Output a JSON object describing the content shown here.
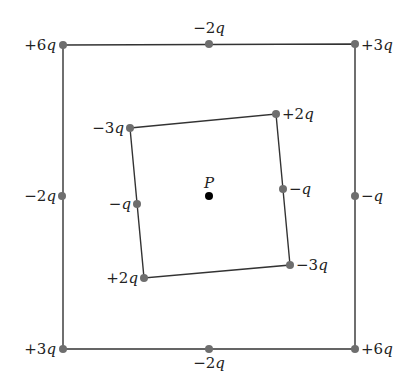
{
  "figure": {
    "point_label": "P",
    "outer_square": {
      "charges": [
        {
          "id": "outer-top-left",
          "label": "+6q",
          "sign": "+",
          "value": "6",
          "x": 63,
          "y": 45,
          "lx": 56,
          "ly": 50,
          "anchor": "end"
        },
        {
          "id": "outer-top-mid",
          "label": "−2q",
          "sign": "−",
          "value": "2",
          "x": 209,
          "y": 44,
          "lx": 209,
          "ly": 33,
          "anchor": "middle"
        },
        {
          "id": "outer-top-right",
          "label": "+3q",
          "sign": "+",
          "value": "3",
          "x": 355,
          "y": 44,
          "lx": 361,
          "ly": 50,
          "anchor": "start"
        },
        {
          "id": "outer-mid-left",
          "label": "−2q",
          "sign": "−",
          "value": "2",
          "x": 62,
          "y": 196,
          "lx": 56,
          "ly": 201,
          "anchor": "end"
        },
        {
          "id": "outer-mid-right",
          "label": "−q",
          "sign": "−",
          "value": "",
          "x": 355,
          "y": 196,
          "lx": 361,
          "ly": 201,
          "anchor": "start"
        },
        {
          "id": "outer-bottom-left",
          "label": "+3q",
          "sign": "+",
          "value": "3",
          "x": 63,
          "y": 349,
          "lx": 56,
          "ly": 354,
          "anchor": "end"
        },
        {
          "id": "outer-bottom-mid",
          "label": "−2q",
          "sign": "−",
          "value": "2",
          "x": 209,
          "y": 349,
          "lx": 209,
          "ly": 368,
          "anchor": "middle"
        },
        {
          "id": "outer-bottom-right",
          "label": "+6q",
          "sign": "+",
          "value": "6",
          "x": 355,
          "y": 349,
          "lx": 361,
          "ly": 354,
          "anchor": "start"
        }
      ]
    },
    "inner_square": {
      "charges": [
        {
          "id": "inner-top-left",
          "label": "−3q",
          "sign": "−",
          "value": "3",
          "x": 130,
          "y": 128,
          "lx": 124,
          "ly": 133,
          "anchor": "end"
        },
        {
          "id": "inner-top-right",
          "label": "+2q",
          "sign": "+",
          "value": "2",
          "x": 276,
          "y": 114,
          "lx": 282,
          "ly": 119,
          "anchor": "start"
        },
        {
          "id": "inner-mid-left",
          "label": "−q",
          "sign": "−",
          "value": "",
          "x": 137,
          "y": 204,
          "lx": 131,
          "ly": 209,
          "anchor": "end"
        },
        {
          "id": "inner-mid-right",
          "label": "−q",
          "sign": "−",
          "value": "",
          "x": 283,
          "y": 189,
          "lx": 289,
          "ly": 194,
          "anchor": "start"
        },
        {
          "id": "inner-bottom-left",
          "label": "+2q",
          "sign": "+",
          "value": "2",
          "x": 144,
          "y": 278,
          "lx": 138,
          "ly": 283,
          "anchor": "end"
        },
        {
          "id": "inner-bottom-right",
          "label": "−3q",
          "sign": "−",
          "value": "3",
          "x": 290,
          "y": 265,
          "lx": 296,
          "ly": 270,
          "anchor": "start"
        }
      ]
    },
    "point": {
      "x": 209,
      "y": 196,
      "lx": 209,
      "ly": 184
    },
    "colors": {
      "line": "#333333",
      "charge_dot": "#6e6e6e",
      "point_dot": "#000000",
      "text": "#222222"
    }
  }
}
